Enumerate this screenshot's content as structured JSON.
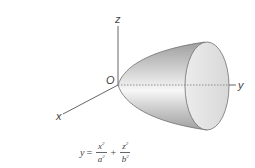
{
  "diagram": {
    "axes": {
      "x_label": "x",
      "y_label": "y",
      "z_label": "z",
      "origin_label": "O"
    },
    "equation": {
      "lhs": "y",
      "equals": "=",
      "term1_num": "x",
      "term1_num_exp": "2",
      "term1_den": "a",
      "term1_den_exp": "2",
      "plus": "+",
      "term2_num": "z",
      "term2_num_exp": "2",
      "term2_den": "b",
      "term2_den_exp": "2"
    },
    "colors": {
      "axis": "#666666",
      "surface_light": "#f2f2f2",
      "surface_dark": "#a8a8a8",
      "end_cap": "#e2e2e2",
      "outline": "#6e6e6e"
    }
  }
}
